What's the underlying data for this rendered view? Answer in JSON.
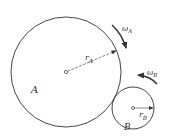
{
  "diagram": {
    "type": "two contacting wheels (gears) with angular velocities",
    "colors": {
      "stroke": "#333333",
      "background": "#ffffff"
    },
    "wheel_a": {
      "label": "A",
      "radius_label": "r",
      "radius_sub": "A",
      "omega_label": "ω",
      "omega_sub": "A",
      "rotation": "clockwise"
    },
    "wheel_b": {
      "label": "B",
      "radius_label": "r",
      "radius_sub": "B",
      "omega_label": "ω",
      "omega_sub": "B",
      "rotation": "counter-clockwise"
    }
  }
}
